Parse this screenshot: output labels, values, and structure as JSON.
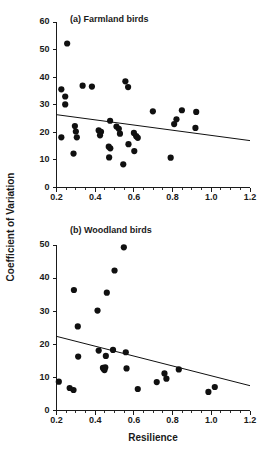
{
  "figure": {
    "width": 273,
    "height": 454,
    "background": "#ffffff",
    "ink_color": "#101010",
    "shared_ylabel": "Coefficient of Variation",
    "shared_xlabel": "Resilience"
  },
  "chart_data": [
    {
      "type": "scatter",
      "panel": "a",
      "title": "(a)  Farmland birds",
      "xlabel": "Resilience",
      "ylabel": "Coefficient of Variation",
      "xlim": [
        0.2,
        1.2
      ],
      "ylim": [
        0,
        60
      ],
      "xticks": [
        0.2,
        0.4,
        0.6,
        0.8,
        1.0,
        1.2
      ],
      "xticklabels": [
        "0.2",
        "0.4",
        "0.6",
        "0.8",
        "1.0",
        "1.2"
      ],
      "yticks": [
        0,
        10,
        20,
        30,
        40,
        50,
        60
      ],
      "yticklabels": [
        "0",
        "10",
        "20",
        "30",
        "40",
        "50",
        "60"
      ],
      "x_minor_tick_step": 0.05,
      "grid": false,
      "legend": null,
      "marker": "filled-circle",
      "marker_size_px": 3.1,
      "points": [
        {
          "x": 0.255,
          "y": 52.2
        },
        {
          "x": 0.225,
          "y": 35.6
        },
        {
          "x": 0.245,
          "y": 33.0
        },
        {
          "x": 0.245,
          "y": 30.1
        },
        {
          "x": 0.225,
          "y": 18.2
        },
        {
          "x": 0.295,
          "y": 22.3
        },
        {
          "x": 0.3,
          "y": 20.3
        },
        {
          "x": 0.305,
          "y": 18.2
        },
        {
          "x": 0.288,
          "y": 12.3
        },
        {
          "x": 0.335,
          "y": 36.9
        },
        {
          "x": 0.383,
          "y": 36.6
        },
        {
          "x": 0.418,
          "y": 20.7
        },
        {
          "x": 0.43,
          "y": 20.2
        },
        {
          "x": 0.425,
          "y": 18.9
        },
        {
          "x": 0.477,
          "y": 24.2
        },
        {
          "x": 0.47,
          "y": 14.8
        },
        {
          "x": 0.478,
          "y": 14.2
        },
        {
          "x": 0.472,
          "y": 10.9
        },
        {
          "x": 0.51,
          "y": 22.1
        },
        {
          "x": 0.522,
          "y": 21.3
        },
        {
          "x": 0.528,
          "y": 19.5
        },
        {
          "x": 0.545,
          "y": 8.4
        },
        {
          "x": 0.556,
          "y": 38.5
        },
        {
          "x": 0.57,
          "y": 36.4
        },
        {
          "x": 0.572,
          "y": 15.7
        },
        {
          "x": 0.6,
          "y": 19.8
        },
        {
          "x": 0.612,
          "y": 18.6
        },
        {
          "x": 0.62,
          "y": 18.0
        },
        {
          "x": 0.602,
          "y": 13.2
        },
        {
          "x": 0.698,
          "y": 27.6
        },
        {
          "x": 0.79,
          "y": 10.8
        },
        {
          "x": 0.808,
          "y": 23.0
        },
        {
          "x": 0.82,
          "y": 24.7
        },
        {
          "x": 0.848,
          "y": 28.0
        },
        {
          "x": 0.922,
          "y": 27.4
        },
        {
          "x": 0.918,
          "y": 21.6
        }
      ],
      "trend_line": {
        "x_start": 0.2,
        "y_start": 26.4,
        "x_end": 1.2,
        "y_end": 17.0,
        "slope": -9.4,
        "intercept": 28.28
      }
    },
    {
      "type": "scatter",
      "panel": "b",
      "title": "(b)  Woodland birds",
      "xlabel": "Resilience",
      "ylabel": "Coefficient of Variation",
      "xlim": [
        0.2,
        1.2
      ],
      "ylim": [
        0,
        50
      ],
      "xticks": [
        0.2,
        0.4,
        0.6,
        0.8,
        1.0,
        1.2
      ],
      "xticklabels": [
        "0.2",
        "0.4",
        "0.6",
        "0.8",
        "1.0",
        "1.2"
      ],
      "yticks": [
        0,
        10,
        20,
        30,
        40,
        50
      ],
      "yticklabels": [
        "0",
        "10",
        "20",
        "30",
        "40",
        "50"
      ],
      "x_minor_tick_step": 0.05,
      "grid": false,
      "legend": null,
      "marker": "filled-circle",
      "marker_size_px": 3.1,
      "points": [
        {
          "x": 0.212,
          "y": 8.7
        },
        {
          "x": 0.268,
          "y": 6.8
        },
        {
          "x": 0.288,
          "y": 6.2
        },
        {
          "x": 0.29,
          "y": 36.4
        },
        {
          "x": 0.31,
          "y": 25.4
        },
        {
          "x": 0.312,
          "y": 16.3
        },
        {
          "x": 0.412,
          "y": 30.2
        },
        {
          "x": 0.418,
          "y": 18.1
        },
        {
          "x": 0.44,
          "y": 12.9
        },
        {
          "x": 0.443,
          "y": 12.6
        },
        {
          "x": 0.448,
          "y": 12.2
        },
        {
          "x": 0.452,
          "y": 13.0
        },
        {
          "x": 0.455,
          "y": 16.5
        },
        {
          "x": 0.46,
          "y": 35.6
        },
        {
          "x": 0.492,
          "y": 18.3
        },
        {
          "x": 0.5,
          "y": 42.3
        },
        {
          "x": 0.548,
          "y": 49.3
        },
        {
          "x": 0.558,
          "y": 17.6
        },
        {
          "x": 0.562,
          "y": 12.7
        },
        {
          "x": 0.62,
          "y": 6.5
        },
        {
          "x": 0.718,
          "y": 8.6
        },
        {
          "x": 0.758,
          "y": 11.2
        },
        {
          "x": 0.768,
          "y": 9.6
        },
        {
          "x": 0.832,
          "y": 12.4
        },
        {
          "x": 0.985,
          "y": 5.6
        },
        {
          "x": 1.018,
          "y": 7.1
        }
      ],
      "trend_line": {
        "x_start": 0.2,
        "y_start": 22.4,
        "x_end": 1.2,
        "y_end": 7.5,
        "slope": -14.9,
        "intercept": 25.38
      }
    }
  ]
}
